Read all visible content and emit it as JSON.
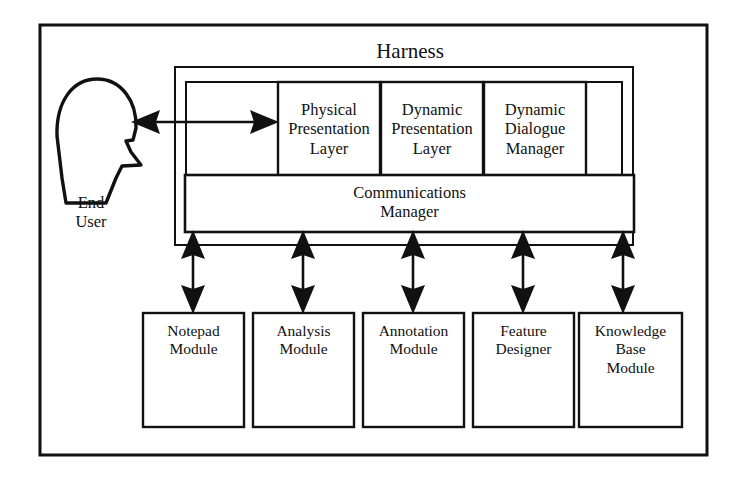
{
  "diagram": {
    "title": "Harness",
    "actor": {
      "name": "End User",
      "label": "End\nUser",
      "icon": "head-profile-icon"
    },
    "harness": {
      "title": "Harness",
      "layers": [
        {
          "id": "physical-presentation-layer",
          "label": "Physical\nPresentation\nLayer"
        },
        {
          "id": "dynamic-presentation-layer",
          "label": "Dynamic\nPresentation\nLayer"
        },
        {
          "id": "dynamic-dialogue-manager",
          "label": "Dynamic\nDialogue\nManager"
        }
      ],
      "communications_manager": {
        "id": "communications-manager",
        "label": "Communications\nManager"
      }
    },
    "modules": [
      {
        "id": "notepad-module",
        "label": "Notepad\nModule"
      },
      {
        "id": "analysis-module",
        "label": "Analysis\nModule"
      },
      {
        "id": "annotation-module",
        "label": "Annotation\nModule"
      },
      {
        "id": "feature-designer",
        "label": "Feature\nDesigner"
      },
      {
        "id": "knowledge-base-module",
        "label": "Knowledge\nBase\nModule"
      }
    ],
    "connectors": [
      {
        "id": "user-to-harness",
        "kind": "double-headed-arrow",
        "orientation": "horizontal"
      },
      {
        "id": "comm-to-notepad",
        "kind": "double-headed-arrow",
        "orientation": "vertical"
      },
      {
        "id": "comm-to-analysis",
        "kind": "double-headed-arrow",
        "orientation": "vertical"
      },
      {
        "id": "comm-to-annotation",
        "kind": "double-headed-arrow",
        "orientation": "vertical"
      },
      {
        "id": "comm-to-feature-designer",
        "kind": "double-headed-arrow",
        "orientation": "vertical"
      },
      {
        "id": "comm-to-knowledge-base",
        "kind": "double-headed-arrow",
        "orientation": "vertical"
      }
    ],
    "colors": {
      "stroke": "#111111",
      "fill": "#ffffff",
      "text": "#111111"
    }
  }
}
